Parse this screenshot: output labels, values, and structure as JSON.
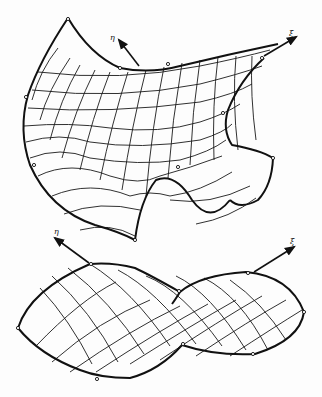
{
  "figure": {
    "top_surface": {
      "axis_labels": {
        "eta": "η",
        "xi": "ξ"
      },
      "description": "Doubly-curved saddle-like mesh surface with folded lower edge"
    },
    "bottom_surface": {
      "axis_labels": {
        "eta": "η",
        "xi": "ξ"
      },
      "description": "Twisted elongated mesh surface"
    },
    "colors": {
      "line": "#111111",
      "background": "#fdfdfd"
    }
  }
}
